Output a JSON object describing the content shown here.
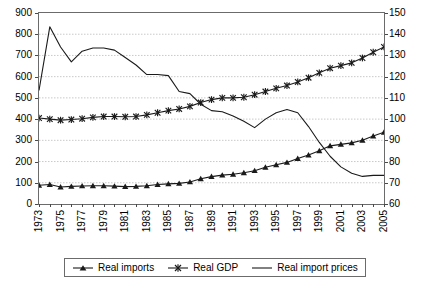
{
  "chart_data": {
    "type": "line",
    "title": "",
    "xlabel": "",
    "ylabel": "",
    "y2label": "",
    "grid": true,
    "legend_position": "bottom",
    "xlim": [
      1973,
      2005
    ],
    "ylim": [
      0,
      900
    ],
    "y2lim": [
      60,
      150
    ],
    "ytick_step": 100,
    "y2tick_step": 10,
    "xtick_step": 1,
    "xtick_label_step": 2,
    "x": [
      1973,
      1974,
      1975,
      1976,
      1977,
      1978,
      1979,
      1980,
      1981,
      1982,
      1983,
      1984,
      1985,
      1986,
      1987,
      1988,
      1989,
      1990,
      1991,
      1992,
      1993,
      1994,
      1995,
      1996,
      1997,
      1998,
      1999,
      2000,
      2001,
      2002,
      2003,
      2004,
      2005
    ],
    "xtick_labels": [
      "1973",
      "1975",
      "1977",
      "1979",
      "1981",
      "1983",
      "1985",
      "1987",
      "1989",
      "1991",
      "1993",
      "1995",
      "1997",
      "1999",
      "2001",
      "2003",
      "2005"
    ],
    "ytick_labels": [
      "0",
      "100",
      "200",
      "300",
      "400",
      "500",
      "600",
      "700",
      "800",
      "900"
    ],
    "y2tick_labels": [
      "60",
      "70",
      "80",
      "90",
      "100",
      "110",
      "120",
      "130",
      "140",
      "150"
    ],
    "series": [
      {
        "name": "Real imports",
        "axis": "left",
        "marker": "triangle",
        "values": [
          88,
          92,
          80,
          83,
          85,
          86,
          86,
          84,
          82,
          83,
          86,
          92,
          95,
          97,
          104,
          119,
          129,
          136,
          140,
          147,
          157,
          173,
          185,
          196,
          214,
          231,
          251,
          274,
          281,
          288,
          300,
          320,
          338
        ]
      },
      {
        "name": "Real GDP",
        "axis": "left",
        "marker": "star",
        "values": [
          405,
          400,
          395,
          398,
          402,
          408,
          412,
          412,
          411,
          412,
          420,
          430,
          440,
          448,
          460,
          478,
          492,
          500,
          500,
          503,
          515,
          530,
          545,
          558,
          575,
          595,
          618,
          640,
          652,
          665,
          688,
          715,
          740
        ]
      },
      {
        "name": "Real import prices",
        "axis": "right",
        "marker": "none",
        "values": [
          113.5,
          143.5,
          134.0,
          127.0,
          132.0,
          133.5,
          133.5,
          132.5,
          129.0,
          125.5,
          121.0,
          121.0,
          120.5,
          113.0,
          112.0,
          107.0,
          104.0,
          103.5,
          101.5,
          99.0,
          96.0,
          100.0,
          103.0,
          104.5,
          103.0,
          96.5,
          89.0,
          82.5,
          77.5,
          74.5,
          73.0,
          73.5,
          73.5
        ]
      }
    ]
  },
  "legend": {
    "items": [
      {
        "label": "Real imports",
        "symbol": "triangle-line"
      },
      {
        "label": "Real GDP",
        "symbol": "star-line"
      },
      {
        "label": "Real import prices",
        "symbol": "plain-line"
      }
    ]
  },
  "colors": {
    "line": "#1a1a1a",
    "grid": "#c9c9c9",
    "frame": "#6b6b6b",
    "background": "#ffffff"
  }
}
